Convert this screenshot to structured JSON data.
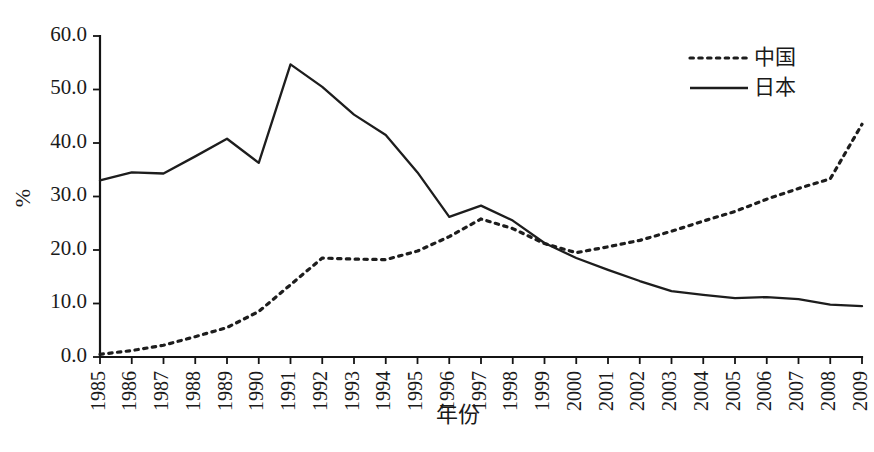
{
  "chart_data": {
    "type": "line",
    "title": "",
    "subtitle": "",
    "xlabel": "年份",
    "ylabel": "%",
    "xlim": [
      1985,
      2009
    ],
    "ylim": [
      0.0,
      60.0
    ],
    "grid": false,
    "legend_position": "top-right",
    "x": [
      1985,
      1986,
      1987,
      1988,
      1989,
      1990,
      1991,
      1992,
      1993,
      1994,
      1995,
      1996,
      1997,
      1998,
      1999,
      2000,
      2001,
      2002,
      2003,
      2004,
      2005,
      2006,
      2007,
      2008,
      2009
    ],
    "xtick_labels": [
      "1985",
      "1986",
      "1987",
      "1988",
      "1989",
      "1990",
      "1991",
      "1992",
      "1993",
      "1994",
      "1995",
      "1996",
      "1997",
      "1998",
      "1999",
      "2000",
      "2001",
      "2002",
      "2003",
      "2004",
      "2005",
      "2006",
      "2007",
      "2008",
      "2009"
    ],
    "ytick_labels": [
      "0.0",
      "10.0",
      "20.0",
      "30.0",
      "40.0",
      "50.0",
      "60.0"
    ],
    "ytick_values": [
      0.0,
      10.0,
      20.0,
      30.0,
      40.0,
      50.0,
      60.0
    ],
    "series": [
      {
        "name": "中国",
        "style": "dotted",
        "color": "#1d1d1d",
        "values": [
          0.5,
          1.2,
          2.2,
          3.8,
          5.5,
          8.5,
          13.5,
          18.5,
          18.3,
          18.2,
          19.8,
          22.5,
          25.8,
          24.0,
          21.2,
          19.5,
          20.6,
          21.8,
          23.5,
          25.4,
          27.2,
          29.5,
          31.5,
          33.3,
          43.5
        ]
      },
      {
        "name": "日本",
        "style": "solid",
        "color": "#1d1d1d",
        "values": [
          33.0,
          34.5,
          34.3,
          37.5,
          40.8,
          36.3,
          54.7,
          50.5,
          45.3,
          41.5,
          34.5,
          26.2,
          28.3,
          25.5,
          21.3,
          18.5,
          16.3,
          14.2,
          12.3,
          11.6,
          11.0,
          11.2,
          10.8,
          9.8,
          9.5
        ]
      }
    ]
  },
  "legend": {
    "items": [
      {
        "label": "中国",
        "style": "dotted"
      },
      {
        "label": "日本",
        "style": "solid"
      }
    ]
  },
  "axes": {
    "y_axis_label": "%",
    "x_axis_label": "年份"
  }
}
